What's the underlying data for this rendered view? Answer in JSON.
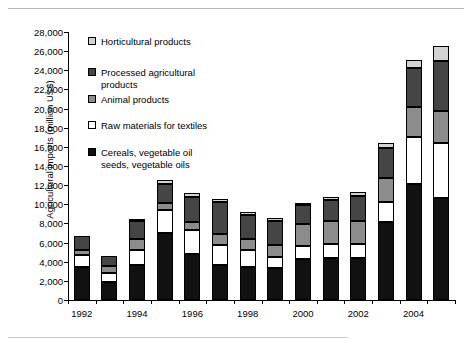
{
  "chart_data": {
    "type": "bar",
    "subtype": "stacked",
    "title": "",
    "xlabel": "",
    "ylabel": "Agricultural imports (million US$)",
    "ylim": [
      0,
      28000
    ],
    "ytick_step": 2000,
    "grid": false,
    "legend_position": "inside-top-left",
    "x": [
      1992,
      1993,
      1994,
      1995,
      1996,
      1997,
      1998,
      1999,
      2000,
      2001,
      2002,
      2003,
      2004,
      2005
    ],
    "categories": [
      "1992",
      "1993",
      "1994",
      "1995",
      "1996",
      "1997",
      "1998",
      "1999",
      "2000",
      "2001",
      "2002",
      "2003",
      "2004",
      "2005"
    ],
    "xtick_labels_shown": [
      "1992",
      "1994",
      "1996",
      "1998",
      "2000",
      "2002",
      "2004"
    ],
    "ytick_labels": [
      "0",
      "2,000",
      "4,000",
      "6,000",
      "8,000",
      "10,000",
      "12,000",
      "14,000",
      "16,000",
      "18,000",
      "20,000",
      "22,000",
      "24,000",
      "26,000",
      "28,000"
    ],
    "series": [
      {
        "name": "Cereals, vegetable oil seeds, vegetable oils",
        "color": "#111111",
        "stack_order": 0,
        "values": [
          3400,
          1900,
          3700,
          7000,
          4800,
          3700,
          3500,
          3300,
          4300,
          4400,
          4400,
          8200,
          12100,
          10700
        ]
      },
      {
        "name": "Raw materials for textiles",
        "color": "#ffffff",
        "stack_order": 1,
        "values": [
          1300,
          900,
          1500,
          2400,
          2500,
          2000,
          1700,
          1200,
          1300,
          1500,
          1500,
          2000,
          4900,
          5700
        ]
      },
      {
        "name": "Animal products",
        "color": "#8c8c8c",
        "stack_order": 2,
        "values": [
          500,
          800,
          1200,
          700,
          900,
          1200,
          1200,
          1200,
          2300,
          2400,
          2400,
          2500,
          3200,
          3400
        ]
      },
      {
        "name": "Processed agricultural products",
        "color": "#454545",
        "stack_order": 3,
        "values": [
          1500,
          1000,
          1900,
          2000,
          2600,
          3300,
          2500,
          2600,
          2000,
          2200,
          2600,
          3200,
          4000,
          5200
        ]
      },
      {
        "name": "Horticultural products",
        "color": "#d2d2d2",
        "stack_order": 4,
        "values": [
          0,
          0,
          200,
          400,
          400,
          400,
          300,
          300,
          100,
          300,
          400,
          500,
          900,
          1500
        ]
      }
    ],
    "totals": [
      6700,
      4600,
      8500,
      12500,
      11200,
      10600,
      9200,
      8600,
      10000,
      10800,
      11300,
      16400,
      25100,
      26500
    ],
    "legend_entries": [
      {
        "label": "Horticultural products",
        "color": "#d2d2d2"
      },
      {
        "label": "Processed agricultural\nproducts",
        "color": "#454545"
      },
      {
        "label": "Animal products",
        "color": "#8c8c8c"
      },
      {
        "label": "Raw materials for textiles",
        "color": "#ffffff"
      },
      {
        "label": "Cereals, vegetable oil\nseeds, vegetable oils",
        "color": "#111111"
      }
    ]
  }
}
